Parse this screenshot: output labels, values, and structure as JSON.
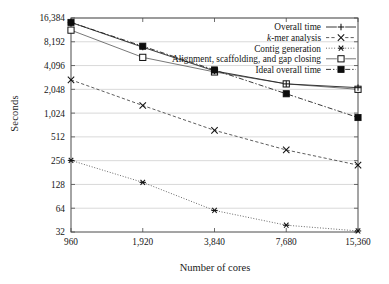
{
  "figure": {
    "ylabel": "Seconds",
    "xlabel": "Number of cores",
    "ytick_labels": [
      "16,384",
      "8,192",
      "4,096",
      "2,048",
      "1,024",
      "512",
      "256",
      "128",
      "64",
      "32"
    ],
    "xtick_labels": [
      "960",
      "1,920",
      "3,840",
      "7,680",
      "15,360"
    ],
    "legend": [
      {
        "label": "Overall time",
        "marker": "plus-marker",
        "line": "solid"
      },
      {
        "label": "k-mer analysis",
        "label_italic_prefix": "k",
        "label_rest": "-mer analysis",
        "marker": "x-marker",
        "line": "dashed"
      },
      {
        "label": "Contig generation",
        "marker": "asterisk-marker",
        "line": "dotted"
      },
      {
        "label": "Alignment, scaffolding, and gap closing",
        "marker": "open-square-marker",
        "line": "solid"
      },
      {
        "label": "Ideal overall time",
        "marker": "filled-square-marker",
        "line": "dash-dot"
      }
    ]
  },
  "chart_data": {
    "type": "line",
    "title": "",
    "xlabel": "Number of cores",
    "ylabel": "Seconds",
    "xscale": "log2",
    "yscale": "log2",
    "x": [
      960,
      1920,
      3840,
      7680,
      15360
    ],
    "xlim": [
      960,
      15360
    ],
    "ylim": [
      32,
      16384
    ],
    "ytick_values": [
      16384,
      8192,
      4096,
      2048,
      1024,
      512,
      256,
      128,
      64,
      32
    ],
    "grid": "horizontal",
    "legend_position": "top-right",
    "series": [
      {
        "name": "Overall time",
        "marker": "plus",
        "linestyle": "solid",
        "values": [
          14400,
          7000,
          3500,
          2400,
          2150
        ]
      },
      {
        "name": "k-mer analysis",
        "marker": "x",
        "linestyle": "dashed",
        "values": [
          2700,
          1280,
          620,
          350,
          225
        ]
      },
      {
        "name": "Contig generation",
        "marker": "asterisk",
        "linestyle": "dotted",
        "values": [
          258,
          136,
          60,
          39,
          33
        ]
      },
      {
        "name": "Alignment, scaffolding, and gap closing",
        "marker": "open square",
        "linestyle": "solid",
        "values": [
          11500,
          5200,
          3400,
          2400,
          2050
        ]
      },
      {
        "name": "Ideal overall time",
        "marker": "filled square",
        "linestyle": "dash-dot",
        "values": [
          14400,
          7200,
          3600,
          1800,
          900
        ]
      }
    ]
  }
}
